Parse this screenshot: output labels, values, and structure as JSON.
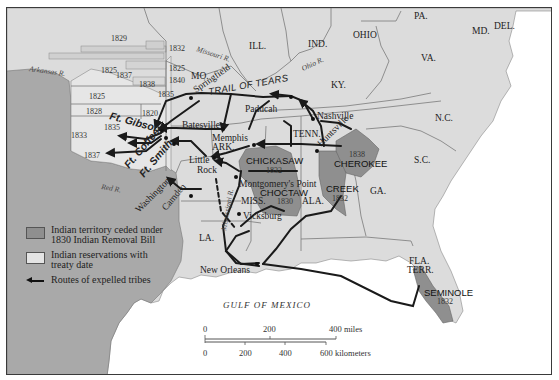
{
  "map": {
    "colors": {
      "frame": "#3a3a3a",
      "land_us": "#dcdcdc",
      "land_west": "#a9a9a9",
      "reservation": "#e4e4e4",
      "ceded_territory": "#8f8f8f",
      "water": "#ffffff",
      "route": "#1a1a1a"
    },
    "states": {
      "ill": "ILL.",
      "ind": "IND.",
      "ohio": "OHIO",
      "pa": "PA.",
      "md": "MD.",
      "del": "DEL.",
      "va": "VA.",
      "ky": "KY.",
      "tenn": "TENN.",
      "nc": "N.C.",
      "sc": "S.C.",
      "ga": "GA.",
      "ala": "ALA.",
      "miss": "MISS.",
      "la": "LA.",
      "ark": "ARK.",
      "mo": "MO.",
      "fla": "FLA.",
      "terr": "TERR."
    },
    "rivers": {
      "arkansas": "Arkansas R.",
      "missouri": "Missouri R.",
      "ohio": "Ohio R.",
      "red": "Red R.",
      "mississippi": "Mississippi R."
    },
    "cities": {
      "springfield": "Springfield",
      "paducah": "Paducah",
      "nashville": "Nashville",
      "huntsville": "Huntsville",
      "batesville": "Batesville",
      "memphis": "Memphis",
      "little": "Little",
      "rock": "Rock",
      "montgomerys_point": "Montgomery's Point",
      "vicksburg": "Vicksburg",
      "new_orleans": "New Orleans",
      "washington": "Washington",
      "camden": "Camden"
    },
    "forts": {
      "gibson": "Ft. Gibson",
      "coffee": "Ft. Coffee",
      "smith": "Ft. Smith"
    },
    "trail_label": "TRAIL OF TEARS",
    "gulf_label": "GULF OF MEXICO",
    "tribes": [
      {
        "name": "CHICKASAW",
        "date": "1832"
      },
      {
        "name": "CHOCTAW",
        "date": "1830"
      },
      {
        "name": "CHEROKEE",
        "date": "1838"
      },
      {
        "name": "CREEK",
        "date": "1832"
      },
      {
        "name": "SEMINOLE",
        "date": "1832"
      }
    ],
    "reservation_dates": {
      "r1829": "1829",
      "r1832": "1832",
      "r1825a": "1825",
      "r1837": "1837",
      "r1825b": "1825",
      "r1840": "1840",
      "r1838": "1838",
      "r1835a": "1835",
      "r1825c": "1825",
      "r1828": "1828",
      "r1820": "1820",
      "r1835b": "1835",
      "r1833": "1833",
      "r1837b": "1837"
    }
  },
  "legend": {
    "items": [
      {
        "label_line1": "Indian territory ceded under",
        "label_line2": "1830 Indian Removal Bill"
      },
      {
        "label_line1": "Indian reservations with",
        "label_line2": "treaty date"
      },
      {
        "label_line1": "Routes of expelled tribes"
      }
    ]
  },
  "scale": {
    "miles": {
      "ticks": [
        "0",
        "200",
        "400 miles"
      ]
    },
    "kilometers": {
      "ticks": [
        "0",
        "200",
        "400",
        "600 kilometers"
      ]
    }
  }
}
